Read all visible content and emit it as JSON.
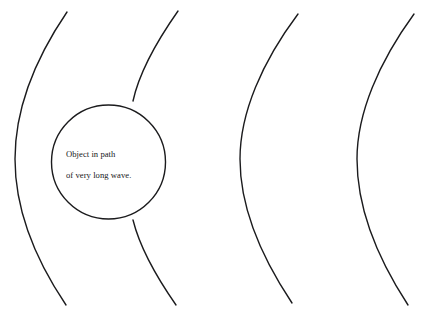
{
  "figure": {
    "width": 424,
    "height": 318,
    "background_color": "#ffffff",
    "stroke_color": "#1b1b1d",
    "stroke_width": 1.4,
    "caption_text": "Object in path of very long wave."
  },
  "object": {
    "name": "object-circle",
    "label_line_1": "Object in path",
    "label_line_2": "of very long wave.",
    "center_x": 108.5,
    "center_y": 162,
    "radius": 57,
    "fill": "none",
    "stroke_color": "#1b1b1d"
  },
  "waves": [
    {
      "name": "wavefront-1",
      "order": 1,
      "top_x": 67,
      "top_y": 12,
      "mid_x": 15,
      "mid_y": 159,
      "bottom_x": 66,
      "bottom_y": 305,
      "blocked_by_object": false,
      "stroke_color": "#1b1b1d"
    },
    {
      "name": "wavefront-2",
      "order": 2,
      "top_x": 178,
      "top_y": 11,
      "mid_x": 127,
      "mid_y": 159,
      "bottom_x": 176,
      "bottom_y": 305,
      "blocked_by_object": true,
      "enters_object_x": 133,
      "enters_object_y": 101,
      "exits_object_x": 133,
      "exits_object_y": 220,
      "stroke_color": "#1b1b1d"
    },
    {
      "name": "wavefront-3",
      "order": 3,
      "top_x": 298,
      "top_y": 14,
      "mid_x": 240,
      "mid_y": 159,
      "bottom_x": 292,
      "bottom_y": 303,
      "blocked_by_object": false,
      "stroke_color": "#1b1b1d"
    },
    {
      "name": "wavefront-4",
      "order": 4,
      "top_x": 414,
      "top_y": 14,
      "mid_x": 357,
      "mid_y": 159,
      "bottom_x": 408,
      "bottom_y": 305,
      "blocked_by_object": false,
      "stroke_color": "#1b1b1d"
    }
  ]
}
